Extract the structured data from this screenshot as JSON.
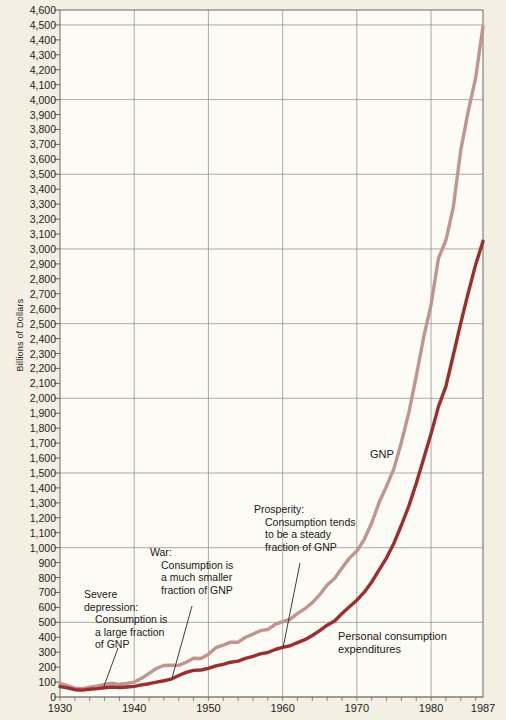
{
  "chart_data": {
    "type": "line",
    "title": "",
    "xlabel": "",
    "ylabel": "Billions of Dollars",
    "xlim": [
      1930,
      1987
    ],
    "ylim": [
      0,
      4600
    ],
    "grid": true,
    "y_major_gridline_step": 500,
    "y_tick_step": 100,
    "legend_position": "inline-labels",
    "x_tick_labels": [
      "1930",
      "1940",
      "1950",
      "1960",
      "1970",
      "1980",
      "1987"
    ],
    "x_tick_values": [
      1930,
      1940,
      1950,
      1960,
      1970,
      1980,
      1987
    ],
    "y_tick_labels": [
      "4,600",
      "4,500",
      "4,400",
      "4,300",
      "4,200",
      "4,100",
      "4,000",
      "3,900",
      "3,800",
      "3,700",
      "3,600",
      "3,500",
      "3,400",
      "3,300",
      "3,200",
      "3,100",
      "3,000",
      "2,900",
      "2,800",
      "2,700",
      "2,600",
      "2,500",
      "2,400",
      "2,300",
      "2,200",
      "2,100",
      "2,000",
      "1,900",
      "1,800",
      "1,700",
      "1,600",
      "1,500",
      "1,400",
      "1,300",
      "1,200",
      "1,100",
      "1,000",
      "900",
      "800",
      "700",
      "600",
      "500",
      "400",
      "300",
      "200",
      "100",
      "0"
    ],
    "y_tick_values": [
      4600,
      4500,
      4400,
      4300,
      4200,
      4100,
      4000,
      3900,
      3800,
      3700,
      3600,
      3500,
      3400,
      3300,
      3200,
      3100,
      3000,
      2900,
      2800,
      2700,
      2600,
      2500,
      2400,
      2300,
      2200,
      2100,
      2000,
      1900,
      1800,
      1700,
      1600,
      1500,
      1400,
      1300,
      1200,
      1100,
      1000,
      900,
      800,
      700,
      600,
      500,
      400,
      300,
      200,
      100,
      0
    ],
    "x": [
      1930,
      1931,
      1932,
      1933,
      1934,
      1935,
      1936,
      1937,
      1938,
      1939,
      1940,
      1941,
      1942,
      1943,
      1944,
      1945,
      1946,
      1947,
      1948,
      1949,
      1950,
      1951,
      1952,
      1953,
      1954,
      1955,
      1956,
      1957,
      1958,
      1959,
      1960,
      1961,
      1962,
      1963,
      1964,
      1965,
      1966,
      1967,
      1968,
      1969,
      1970,
      1971,
      1972,
      1973,
      1974,
      1975,
      1976,
      1977,
      1978,
      1979,
      1980,
      1981,
      1982,
      1983,
      1984,
      1985,
      1986,
      1987
    ],
    "series": [
      {
        "name": "GNP",
        "color": "#c0958f",
        "values": [
          91,
          76,
          59,
          56,
          65,
          73,
          84,
          92,
          85,
          91,
          100,
          125,
          158,
          192,
          211,
          213,
          212,
          233,
          259,
          258,
          286,
          330,
          348,
          367,
          367,
          400,
          421,
          444,
          452,
          487,
          504,
          520,
          560,
          591,
          632,
          685,
          750,
          794,
          864,
          930,
          977,
          1056,
          1165,
          1302,
          1411,
          1529,
          1706,
          1902,
          2147,
          2408,
          2626,
          2938,
          3058,
          3280,
          3661,
          3920,
          4143,
          4490
        ]
      },
      {
        "name": "Personal consumption expenditures",
        "color": "#9b2f2f",
        "values": [
          70,
          61,
          49,
          46,
          52,
          56,
          62,
          67,
          64,
          67,
          71,
          81,
          89,
          100,
          109,
          120,
          144,
          165,
          178,
          181,
          192,
          208,
          219,
          233,
          240,
          259,
          272,
          289,
          298,
          318,
          332,
          343,
          364,
          384,
          412,
          444,
          481,
          509,
          559,
          604,
          648,
          702,
          770,
          852,
          932,
          1030,
          1150,
          1278,
          1430,
          1596,
          1762,
          1944,
          2080,
          2290,
          2503,
          2704,
          2893,
          3052
        ]
      }
    ],
    "annotations": [
      {
        "id": "severe-depression",
        "head": "Severe\ndepression:",
        "body": "Consumption is\na large fraction\nof GNP",
        "target_year": 1935
      },
      {
        "id": "war",
        "head": "War:",
        "body": "Consumption is\na much smaller\nfraction of GNP",
        "target_year": 1944
      },
      {
        "id": "prosperity",
        "head": "Prosperity:",
        "body": "Consumption tends\nto be a steady\nfraction of GNP",
        "target_year": 1960
      }
    ],
    "series_labels": [
      {
        "id": "gnp-label",
        "text": "GNP"
      },
      {
        "id": "pce-label",
        "text": "Personal consumption\nexpenditures"
      }
    ]
  }
}
